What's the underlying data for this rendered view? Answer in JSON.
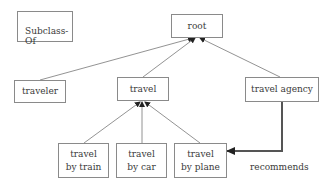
{
  "legend": {
    "label": "Subclass-Of"
  },
  "nodes": {
    "root": {
      "label": "root"
    },
    "traveler": {
      "label": "traveler"
    },
    "travel": {
      "label": "travel"
    },
    "travel_agency": {
      "label": "travel agency"
    },
    "travel_by_train": {
      "line1": "travel",
      "line2": "by train"
    },
    "travel_by_car": {
      "line1": "travel",
      "line2": "by car"
    },
    "travel_by_plane": {
      "line1": "travel",
      "line2": "by plane"
    }
  },
  "edges": {
    "subclass_of": [
      {
        "from": "traveler",
        "to": "root"
      },
      {
        "from": "travel",
        "to": "root"
      },
      {
        "from": "travel agency",
        "to": "root"
      },
      {
        "from": "travel by train",
        "to": "travel"
      },
      {
        "from": "travel by car",
        "to": "travel"
      },
      {
        "from": "travel by plane",
        "to": "travel"
      }
    ],
    "relation": {
      "from": "travel agency",
      "to": "travel by plane",
      "label": "recommends"
    }
  },
  "colors": {
    "border": "#8a8a8a",
    "line": "#6e6e6e",
    "relation_line": "#555555",
    "text": "#3a3a3a"
  }
}
